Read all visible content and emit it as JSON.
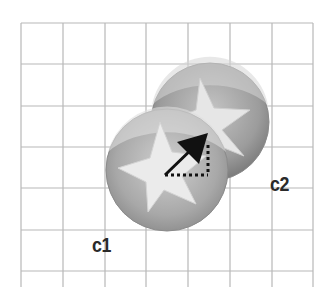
{
  "diagram": {
    "grid": {
      "x_lines": [
        21,
        63,
        105,
        146,
        188,
        230,
        272,
        313
      ],
      "y_lines": [
        23,
        64,
        106,
        147,
        188,
        230,
        271
      ],
      "bottom": 287,
      "color": "#b8b8b8"
    },
    "circles": [
      {
        "id": "c2",
        "label": "c2",
        "cx": 210,
        "cy": 122,
        "r": 59,
        "icon": "star-icon",
        "fill": "#9a9a9a"
      },
      {
        "id": "c1",
        "label": "c1",
        "cx": 167,
        "cy": 170,
        "r": 61,
        "icon": "star-icon",
        "fill": "#a8a8a8"
      }
    ],
    "labels": {
      "c1": "c1",
      "c2": "c2"
    },
    "vector": {
      "from": [
        165,
        175
      ],
      "to": [
        208,
        133
      ],
      "dx_dotted": true,
      "dy_dotted": true,
      "color": "#111111"
    }
  }
}
